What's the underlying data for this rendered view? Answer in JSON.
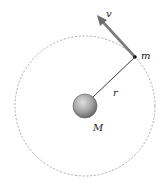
{
  "diagram": {
    "type": "circular-orbit",
    "labels": {
      "velocity": "v",
      "orbiting_mass": "m",
      "radius": "r",
      "central_mass": "M"
    },
    "colors": {
      "orbit": "#999999",
      "arrow": "#7a7a7a",
      "sphere_light": "#d8d8d8",
      "sphere_dark": "#6e6e6e",
      "radius_line": "#222222"
    }
  }
}
